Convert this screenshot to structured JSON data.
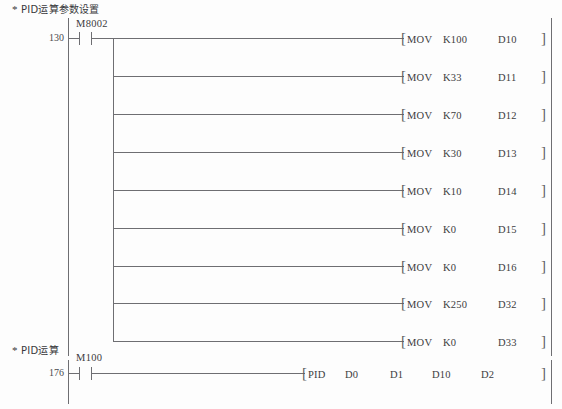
{
  "page": {
    "background_color": "#fdfdfd",
    "line_color": "#6e6e72",
    "text_color": "#3c3c40",
    "width": 562,
    "height": 409
  },
  "networks": [
    {
      "comment_star": "*",
      "comment": "PID运算参数设置",
      "step_number": "130",
      "contact": {
        "device": "M8002",
        "type": "normally-open"
      },
      "branches": [
        {
          "instruction": "MOV",
          "source": "K100",
          "destination": "D10",
          "close": "]"
        },
        {
          "instruction": "MOV",
          "source": "K33",
          "destination": "D11",
          "close": "]"
        },
        {
          "instruction": "MOV",
          "source": "K70",
          "destination": "D12",
          "close": "]"
        },
        {
          "instruction": "MOV",
          "source": "K30",
          "destination": "D13",
          "close": "]"
        },
        {
          "instruction": "MOV",
          "source": "K10",
          "destination": "D14",
          "close": "]"
        },
        {
          "instruction": "MOV",
          "source": "K0",
          "destination": "D15",
          "close": "]"
        },
        {
          "instruction": "MOV",
          "source": "K0",
          "destination": "D16",
          "close": "]"
        },
        {
          "instruction": "MOV",
          "source": "K250",
          "destination": "D32",
          "close": "]"
        },
        {
          "instruction": "MOV",
          "source": "K0",
          "destination": "D33",
          "close": "]"
        }
      ]
    },
    {
      "comment_star": "*",
      "comment": "PID运算",
      "step_number": "176",
      "contact": {
        "device": "M100",
        "type": "normally-open"
      },
      "branches": [
        {
          "instruction": "PID",
          "operand1": "D0",
          "operand2": "D1",
          "operand3": "D10",
          "operand4": "D2",
          "close": "]"
        }
      ]
    }
  ],
  "brackets": {
    "open": "[",
    "close": "]"
  }
}
